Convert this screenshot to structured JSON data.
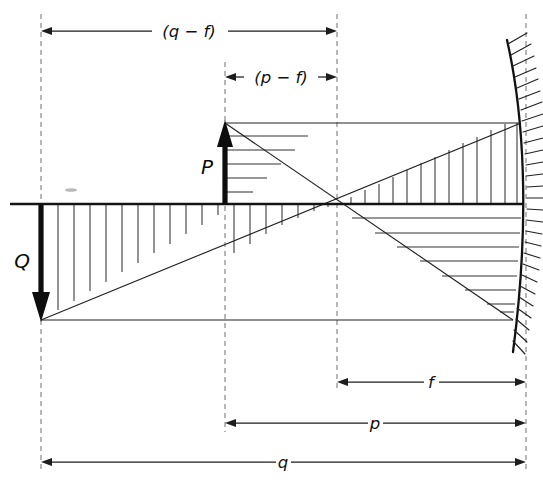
{
  "figure": {
    "kind": "engineering-line-diagram",
    "width": 543,
    "height": 493,
    "background_color": "#ffffff",
    "ink_color": "#111111",
    "dash_color": "#8c8c8c"
  },
  "forces": [
    {
      "id": "P",
      "label": "P",
      "direction": "up",
      "x": 225,
      "from_y": 205,
      "to_y": 122,
      "label_x": 207,
      "label_y": 168
    },
    {
      "id": "Q",
      "label": "Q",
      "direction": "down",
      "x": 41,
      "from_y": 205,
      "to_y": 320,
      "label_x": 22,
      "label_y": 262
    }
  ],
  "stations": [
    {
      "id": "left",
      "x": 41,
      "top_y": 14,
      "bottom_y": 470
    },
    {
      "id": "mid",
      "x": 225,
      "top_y": 62,
      "bottom_y": 432
    },
    {
      "id": "focal",
      "x": 337,
      "top_y": 14,
      "bottom_y": 392
    },
    {
      "id": "mirror",
      "x": 526,
      "top_y": 14,
      "bottom_y": 470
    }
  ],
  "geometry": {
    "axis_y": 204,
    "top_line_y": 123,
    "bottom_line_y": 320,
    "axis_start_x": 10,
    "axis_end_x": 524,
    "cross_x": 337,
    "cross_y": 204,
    "apex_left_x": 225,
    "apex_left_y": 123,
    "base_left_x": 41,
    "base_left_y": 320,
    "mirror_top_x": 521,
    "mirror_top_y": 123,
    "mirror_bottom_x": 513,
    "mirror_bottom_y": 320
  },
  "dimensions": [
    {
      "id": "q-minus-f",
      "label": "(q − f)",
      "y": 31,
      "x1": 41,
      "x2": 337,
      "label_x": 189,
      "arrow_left": true,
      "arrow_right": true
    },
    {
      "id": "p-minus-f",
      "label": "(p − f)",
      "y": 77,
      "x1": 225,
      "x2": 337,
      "label_x": 281,
      "arrow_left": true,
      "arrow_right": true
    },
    {
      "id": "f",
      "label": "f",
      "y": 382,
      "x1": 337,
      "x2": 526,
      "label_x": 431,
      "arrow_left": true,
      "arrow_right": true
    },
    {
      "id": "p",
      "label": "p",
      "y": 423,
      "x1": 225,
      "x2": 526,
      "label_x": 375,
      "arrow_left": true,
      "arrow_right": true
    },
    {
      "id": "q",
      "label": "q",
      "y": 462,
      "x1": 41,
      "x2": 526,
      "label_x": 283,
      "arrow_left": true,
      "arrow_right": true
    }
  ],
  "hatch_regions": [
    {
      "id": "upper-left-triangle",
      "orientation": "horizontal",
      "description": "horizontal hatching between P apex and crossing point, above axis",
      "count": 5
    },
    {
      "id": "upper-right-triangle",
      "orientation": "vertical",
      "description": "vertical hatching from crossing point rising to the mirror, above axis",
      "count": 13
    },
    {
      "id": "lower-left-triangle",
      "orientation": "vertical",
      "description": "vertical hatching from Q base rising to the crossing point, below axis",
      "count": 18
    },
    {
      "id": "lower-right-triangle",
      "orientation": "horizontal",
      "description": "horizontal hatching from crossing point descending to the mirror, below axis",
      "count": 8
    }
  ],
  "mirror": {
    "id": "concave-mirror",
    "hatch_count": 27,
    "hatch_length": 20,
    "description": "curved mirror surface with outward hatching on the right"
  },
  "notes": {
    "speck": "small scan artifact above the axis near the left"
  }
}
